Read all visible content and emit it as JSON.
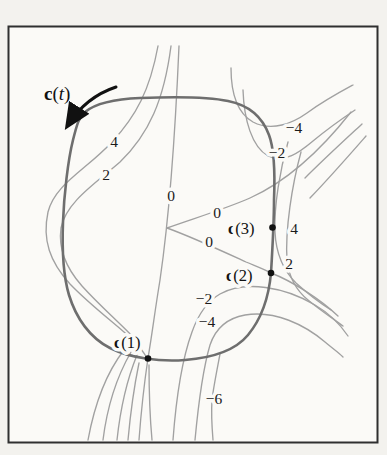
{
  "figure": {
    "curve_label": {
      "bold": "c",
      "open": "(",
      "var": "t",
      "close": ")"
    },
    "points": [
      {
        "id": "c1",
        "prefix": "c",
        "suffix": "(1)"
      },
      {
        "id": "c2",
        "prefix": "c",
        "suffix": "(2)"
      },
      {
        "id": "c3",
        "prefix": "c",
        "suffix": "(3)"
      }
    ],
    "contour_labels": [
      {
        "value": "4",
        "region": "upper-left"
      },
      {
        "value": "2",
        "region": "left"
      },
      {
        "value": "0",
        "region": "center-line"
      },
      {
        "value": "0",
        "region": "wedge-upper"
      },
      {
        "value": "0",
        "region": "wedge-lower"
      },
      {
        "value": "−4",
        "region": "top-right"
      },
      {
        "value": "−2",
        "region": "top-right"
      },
      {
        "value": "4",
        "region": "right"
      },
      {
        "value": "2",
        "region": "right"
      },
      {
        "value": "−2",
        "region": "bottom-center"
      },
      {
        "value": "−4",
        "region": "bottom-center"
      },
      {
        "value": "−6",
        "region": "bottom"
      }
    ],
    "colors": {
      "contour": "#a1a1a1",
      "main_curve": "#6e6e6e",
      "text": "#1b1b1b",
      "frame": "#2f2f2f",
      "paper": "#fbfaf7"
    }
  }
}
